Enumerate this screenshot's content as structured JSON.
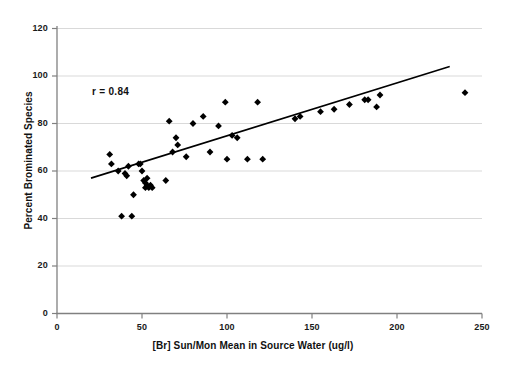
{
  "chart_data": {
    "type": "scatter",
    "title": "",
    "xlabel": "[Br] Sun/Mon Mean in Source Water (ug/l)",
    "ylabel": "Percent Brominated Species",
    "xlim": [
      0,
      250
    ],
    "ylim": [
      0,
      120
    ],
    "xticks": [
      0,
      50,
      100,
      150,
      200,
      250
    ],
    "yticks": [
      0,
      20,
      40,
      60,
      80,
      100,
      120
    ],
    "grid": "horizontal",
    "legend": "none",
    "annotations": [
      {
        "text": "r = 0.84",
        "x": 25,
        "y": 90
      }
    ],
    "series": [
      {
        "name": "Percent Brominated Species vs [Br]",
        "marker": "diamond",
        "color": "#000000",
        "points": [
          [
            31,
            67
          ],
          [
            32,
            63
          ],
          [
            36,
            60
          ],
          [
            38,
            41
          ],
          [
            40,
            59
          ],
          [
            41,
            58
          ],
          [
            42,
            62
          ],
          [
            44,
            41
          ],
          [
            45,
            50
          ],
          [
            48,
            63
          ],
          [
            49,
            63
          ],
          [
            50,
            60
          ],
          [
            51,
            56
          ],
          [
            52,
            55
          ],
          [
            52,
            53
          ],
          [
            53,
            57
          ],
          [
            53,
            54
          ],
          [
            54,
            53
          ],
          [
            55,
            54
          ],
          [
            56,
            53
          ],
          [
            64,
            56
          ],
          [
            66,
            81
          ],
          [
            68,
            68
          ],
          [
            70,
            74
          ],
          [
            71,
            71
          ],
          [
            76,
            66
          ],
          [
            80,
            80
          ],
          [
            86,
            83
          ],
          [
            90,
            68
          ],
          [
            95,
            79
          ],
          [
            99,
            89
          ],
          [
            100,
            65
          ],
          [
            103,
            75
          ],
          [
            106,
            74
          ],
          [
            112,
            65
          ],
          [
            118,
            89
          ],
          [
            121,
            65
          ],
          [
            140,
            82
          ],
          [
            143,
            83
          ],
          [
            155,
            85
          ],
          [
            163,
            86
          ],
          [
            172,
            88
          ],
          [
            181,
            90
          ],
          [
            183,
            90
          ],
          [
            188,
            87
          ],
          [
            190,
            92
          ],
          [
            240,
            93
          ]
        ]
      }
    ],
    "trendline": {
      "name": "linear-fit",
      "color": "#000000",
      "x_start": 20,
      "y_start": 57,
      "x_end": 231,
      "y_end": 104
    }
  },
  "axes": {
    "y_tick_labels": [
      "120",
      "100",
      "80",
      "60",
      "40",
      "20",
      "0"
    ],
    "x_tick_labels": [
      "0",
      "50",
      "100",
      "150",
      "200",
      "250"
    ]
  }
}
